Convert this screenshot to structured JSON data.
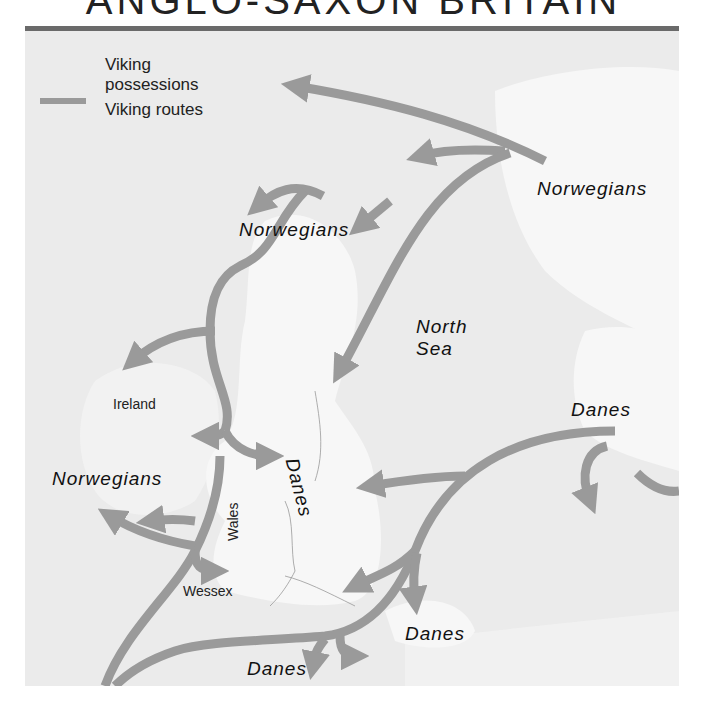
{
  "title": "ANGLO-SAXON BRITAIN",
  "legend": {
    "possessions_label": "Viking possessions",
    "possessions_line1": "Viking",
    "possessions_line2": "possessions",
    "routes_label": "Viking routes"
  },
  "labels": {
    "norwegians_east": "Norwegians",
    "norwegians_scotland": "Norwegians",
    "norwegians_ireland": "Norwegians",
    "north_sea_line1": "North",
    "north_sea_line2": "Sea",
    "danes_denmark": "Danes",
    "danes_danelaw": "Danes",
    "danes_frisia": "Danes",
    "danes_france": "Danes",
    "ireland": "Ireland",
    "wales": "Wales",
    "wessex": "Wessex"
  },
  "colors": {
    "sea": "#ebebeb",
    "land": "#f7f7f7",
    "route": "#9a9a9a",
    "topbar": "#6a6a6a",
    "text": "#111111"
  }
}
